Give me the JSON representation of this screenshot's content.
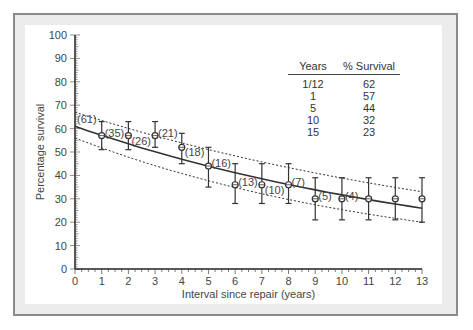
{
  "chart_data": {
    "type": "scatter",
    "title": "",
    "xlabel": "Interval since repair (years)",
    "ylabel": "Percentage survival",
    "xlim": [
      0,
      13
    ],
    "ylim": [
      0,
      100
    ],
    "x_ticks": [
      "0",
      "1",
      "2",
      "3",
      "4",
      "5",
      "6",
      "7",
      "8",
      "9",
      "10",
      "11",
      "12",
      "13"
    ],
    "y_ticks": [
      "0",
      "10",
      "20",
      "30",
      "40",
      "50",
      "60",
      "70",
      "80",
      "90",
      "100"
    ],
    "grid": false,
    "series": [
      {
        "name": "Observed survival",
        "x": [
          1,
          2,
          3,
          4,
          5,
          6,
          7,
          8,
          9,
          10,
          11,
          12,
          13
        ],
        "y": [
          57,
          57,
          57,
          52,
          44,
          36,
          36,
          36,
          30,
          30,
          30,
          30,
          30
        ],
        "error_low": [
          51,
          51,
          52,
          45,
          35,
          28,
          28,
          28,
          21,
          21,
          21,
          21,
          20
        ],
        "error_high": [
          63,
          63,
          63,
          58,
          52,
          45,
          45,
          45,
          39,
          39,
          39,
          39,
          39
        ],
        "labels": [
          "(35)",
          "(26)",
          "(21)",
          "(18)",
          "(16)",
          "(13)",
          "(10)",
          "(7)",
          "(5)",
          "(4)",
          "",
          "",
          ""
        ]
      },
      {
        "name": "Fitted curve",
        "x": [
          0,
          13
        ],
        "y": [
          61,
          26
        ],
        "start_label": "(61)"
      },
      {
        "name": "Upper confidence band",
        "x": [
          0,
          13
        ],
        "y": [
          67,
          33
        ]
      },
      {
        "name": "Lower confidence band",
        "x": [
          0,
          13
        ],
        "y": [
          56,
          20
        ]
      }
    ],
    "annotation_table": {
      "headers": [
        "Years",
        "% Survival"
      ],
      "rows": [
        [
          "1/12",
          "62"
        ],
        [
          "1",
          "57"
        ],
        [
          "5",
          "44"
        ],
        [
          "10",
          "32"
        ],
        [
          "15",
          "23"
        ]
      ]
    }
  },
  "table": {
    "header_years": "Years",
    "header_survival": "% Survival",
    "rows": [
      {
        "years": "1/12",
        "survival": "62"
      },
      {
        "years": "1",
        "survival": "57"
      },
      {
        "years": "5",
        "survival": "44"
      },
      {
        "years": "10",
        "survival": "32"
      },
      {
        "years": "15",
        "survival": "23"
      }
    ]
  },
  "colors": {
    "line": "#333333",
    "axis": "#222222",
    "frame_border": "#8a8a8a",
    "frame_bg": "#ebebeb"
  }
}
